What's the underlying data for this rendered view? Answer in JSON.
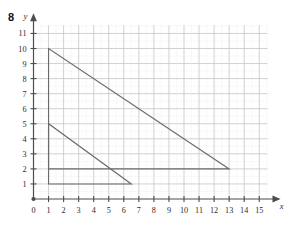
{
  "problem": {
    "number": "8"
  },
  "axes": {
    "x_label": "x",
    "y_label": "y",
    "x_ticks": [
      "0",
      "1",
      "2",
      "3",
      "4",
      "5",
      "6",
      "7",
      "8",
      "9",
      "10",
      "11",
      "12",
      "13",
      "14",
      "15"
    ],
    "y_ticks": [
      "1",
      "2",
      "3",
      "4",
      "5",
      "6",
      "7",
      "8",
      "9",
      "10",
      "11"
    ],
    "origin_label": "0"
  },
  "colors": {
    "axis": "#4d4d4d",
    "shape_stroke": "#6b6b6b",
    "grid_major": "#c9c9c9",
    "grid_minor": "#d8d8d8",
    "text": "#2b2b2b"
  },
  "chart_data": {
    "type": "line",
    "title": "",
    "xlabel": "x",
    "ylabel": "y",
    "xlim": [
      0,
      15.6
    ],
    "ylim": [
      0,
      11.6
    ],
    "grid": true,
    "x_ticks": [
      0,
      1,
      2,
      3,
      4,
      5,
      6,
      7,
      8,
      9,
      10,
      11,
      12,
      13,
      14,
      15
    ],
    "y_ticks": [
      1,
      2,
      3,
      4,
      5,
      6,
      7,
      8,
      9,
      10,
      11
    ],
    "series": [
      {
        "name": "large-triangle",
        "closed": true,
        "points": [
          [
            1,
            10
          ],
          [
            1,
            2
          ],
          [
            13,
            2
          ]
        ],
        "legs": {
          "vertical": 8,
          "horizontal": 12
        }
      },
      {
        "name": "small-triangle",
        "closed": true,
        "points": [
          [
            1,
            5
          ],
          [
            1,
            1
          ],
          [
            6.5,
            1
          ]
        ],
        "legs": {
          "vertical": 4,
          "horizontal": 5.5
        }
      }
    ],
    "annotations": []
  }
}
